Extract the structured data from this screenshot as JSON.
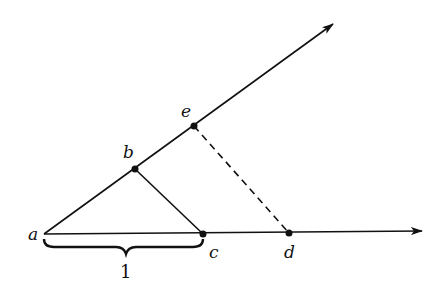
{
  "diagram": {
    "labels": {
      "a": "a",
      "b": "b",
      "c": "c",
      "d": "d",
      "e": "e",
      "unit": "1"
    },
    "points": {
      "a": [
        44,
        234
      ],
      "b": [
        135,
        169
      ],
      "c": [
        203,
        234
      ],
      "d": [
        289,
        233
      ],
      "e": [
        194,
        126
      ]
    },
    "segments": [
      {
        "from": "a",
        "to": "ray1_end",
        "style": "solid",
        "arrow": true
      },
      {
        "from": "a",
        "to": "ray2_end",
        "style": "solid",
        "arrow": true
      },
      {
        "from": "b",
        "to": "c",
        "style": "solid"
      },
      {
        "from": "e",
        "to": "d",
        "style": "dashed"
      }
    ],
    "brace": {
      "from": "a",
      "to": "c",
      "label": "1"
    },
    "stroke_color": "#111111"
  }
}
